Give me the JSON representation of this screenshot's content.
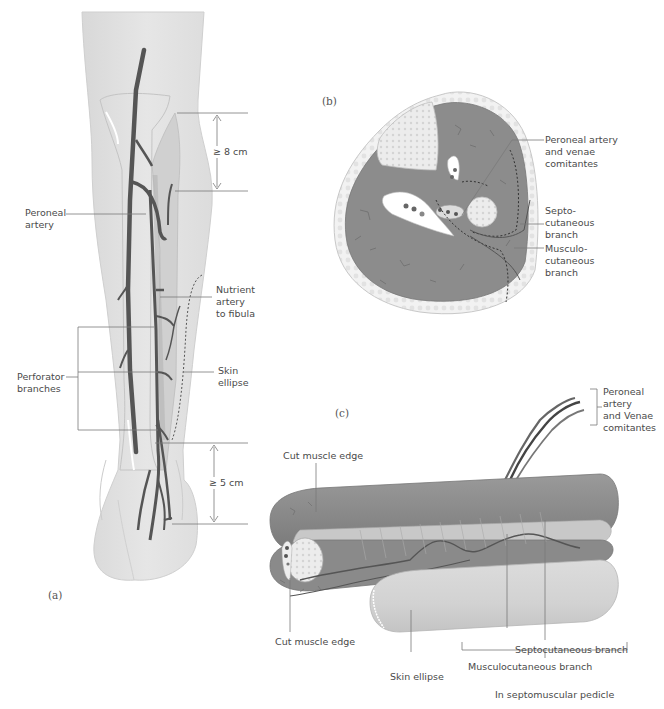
{
  "figure": {
    "panels": {
      "a": "(a)",
      "b": "(b)",
      "c": "(c)"
    },
    "panel_a": {
      "labels": {
        "peroneal_artery": [
          "Peroneal",
          "artery"
        ],
        "nutrient_artery": [
          "Nutrient",
          "artery",
          "to fibula"
        ],
        "skin_ellipse": [
          "Skin",
          "ellipse"
        ],
        "perforator_branches": [
          "Perforator",
          "branches"
        ]
      },
      "measurements": {
        "proximal": "≥ 8 cm",
        "distal": "≥ 5 cm"
      }
    },
    "panel_b": {
      "labels": {
        "peroneal_artery_venae": [
          "Peroneal artery",
          "and venae",
          "comitantes"
        ],
        "septocutaneous": [
          "Septo-",
          "cutaneous",
          "branch"
        ],
        "musculocutaneous": [
          "Musculo-",
          "cutaneous",
          "branch"
        ]
      }
    },
    "panel_c": {
      "labels": {
        "peroneal_artery_venae": [
          "Peroneal",
          "artery",
          "and Venae",
          "comitantes"
        ],
        "cut_muscle_edge_top": "Cut muscle edge",
        "cut_muscle_edge_bottom": "Cut muscle edge",
        "skin_ellipse": "Skin ellipse",
        "septocutaneous_branch": "Septocutaneous branch",
        "musculocutaneous_branch": "Musculocutaneous branch",
        "in_septomuscular_pedicle": "In septomuscular pedicle"
      }
    },
    "colors": {
      "skin": "#e3e3e3",
      "muscle": "#8a8a8a",
      "muscle_dark": "#777777",
      "bone": "#ececec",
      "vessel": "#555555",
      "leader_line": "#7a7a7a",
      "text": "#4a4a4a"
    }
  }
}
